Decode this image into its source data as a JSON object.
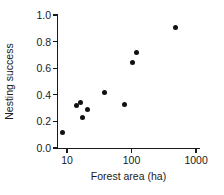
{
  "chart_data": {
    "type": "scatter",
    "title": "",
    "xlabel": "Forest area (ha)",
    "ylabel": "Nesting success",
    "xscale": "log",
    "yscale": "linear",
    "xlim": [
      7,
      1150
    ],
    "ylim": [
      0.0,
      1.0
    ],
    "grid": false,
    "legend": null,
    "xticks": [
      {
        "value": 10,
        "label": "10"
      },
      {
        "value": 100,
        "label": "100"
      },
      {
        "value": 1000,
        "label": "1000"
      }
    ],
    "yticks": [
      {
        "value": 0.0,
        "label": "0.0"
      },
      {
        "value": 0.2,
        "label": "0.2"
      },
      {
        "value": 0.4,
        "label": "0.4"
      },
      {
        "value": 0.6,
        "label": "0.6"
      },
      {
        "value": 0.8,
        "label": "0.8"
      },
      {
        "value": 1.0,
        "label": "1.0"
      }
    ],
    "marker": {
      "shape": "circle",
      "color": "#111111",
      "size_px": 5
    },
    "points": [
      {
        "x": 8.5,
        "y": 0.12
      },
      {
        "x": 14.0,
        "y": 0.32
      },
      {
        "x": 16.0,
        "y": 0.34
      },
      {
        "x": 17.5,
        "y": 0.23
      },
      {
        "x": 21.0,
        "y": 0.29
      },
      {
        "x": 38.0,
        "y": 0.42
      },
      {
        "x": 78.0,
        "y": 0.325
      },
      {
        "x": 103.0,
        "y": 0.645
      },
      {
        "x": 118.0,
        "y": 0.715
      },
      {
        "x": 480.0,
        "y": 0.905
      }
    ]
  }
}
